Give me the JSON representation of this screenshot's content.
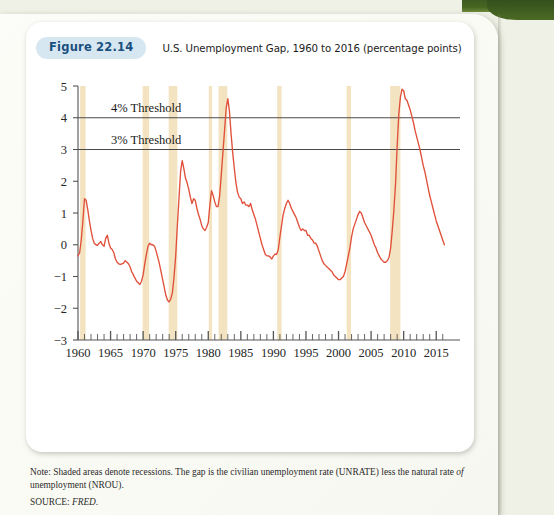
{
  "figure": {
    "badge": "Figure 22.14",
    "title": "U.S. Unemployment Gap, 1960 to 2016 (percentage points)"
  },
  "notes": {
    "note_prefix": "Note: Shaded areas denote recessions. The gap is the civilian unemployment rate (UNRATE) less the natural rate ",
    "note_italic": "of",
    "note_suffix": " unemployment (NROU).",
    "source_label": "SOURCE: ",
    "source_value": "FRED."
  },
  "colors": {
    "line": "#e0503a",
    "recession_band": "#f3e3c0",
    "threshold_line": "#4a4a4a",
    "axis": "#555555",
    "badge_bg": "#d7e7f2",
    "badge_text": "#19507e",
    "card_bg": "#ffffff",
    "page_bg": "#f0f1e6",
    "green_strip": "#46661f"
  },
  "chart_data": {
    "type": "line",
    "title": "U.S. Unemployment Gap, 1960 to 2016 (percentage points)",
    "xlabel": "",
    "ylabel": "",
    "xlim": [
      1960,
      2016.5
    ],
    "ylim": [
      -3,
      5
    ],
    "grid": false,
    "legend": "none",
    "y_ticks": [
      -3,
      -2,
      -1,
      0,
      1,
      2,
      3,
      4,
      5
    ],
    "y_tick_labels": [
      "−3",
      "−2",
      "−1",
      "0",
      "1",
      "2",
      "3",
      "4",
      "5"
    ],
    "x_ticks_major": [
      1960,
      1965,
      1970,
      1975,
      1980,
      1985,
      1990,
      1995,
      2000,
      2005,
      2010,
      2015
    ],
    "x_tick_labels": [
      "1960",
      "1965",
      "1970",
      "1975",
      "1980",
      "1985",
      "1990",
      "1995",
      "2000",
      "2005",
      "2010",
      "2015"
    ],
    "x_minor_tick_step": 1,
    "annotations": [
      {
        "label": "4% Threshold",
        "y": 4,
        "type": "hline"
      },
      {
        "label": "3% Threshold",
        "y": 3,
        "type": "hline"
      }
    ],
    "recessions": [
      {
        "start": 1960.33,
        "end": 1961.17
      },
      {
        "start": 1969.92,
        "end": 1970.92
      },
      {
        "start": 1973.92,
        "end": 1975.25
      },
      {
        "start": 1980.08,
        "end": 1980.58
      },
      {
        "start": 1981.58,
        "end": 1982.92
      },
      {
        "start": 1990.58,
        "end": 1991.25
      },
      {
        "start": 2001.25,
        "end": 2001.92
      },
      {
        "start": 2007.92,
        "end": 2009.5
      }
    ],
    "series": [
      {
        "name": "Unemployment gap (UNRATE − NROU)",
        "color": "#e0503a",
        "x": [
          1960.0,
          1960.25,
          1960.5,
          1960.75,
          1961.0,
          1961.25,
          1961.5,
          1961.75,
          1962.0,
          1962.25,
          1962.5,
          1962.75,
          1963.0,
          1963.25,
          1963.5,
          1963.75,
          1964.0,
          1964.25,
          1964.5,
          1964.75,
          1965.0,
          1965.25,
          1965.5,
          1965.75,
          1966.0,
          1966.25,
          1966.5,
          1966.75,
          1967.0,
          1967.25,
          1967.5,
          1967.75,
          1968.0,
          1968.25,
          1968.5,
          1968.75,
          1969.0,
          1969.25,
          1969.5,
          1969.75,
          1970.0,
          1970.25,
          1970.5,
          1970.75,
          1971.0,
          1971.25,
          1971.5,
          1971.75,
          1972.0,
          1972.25,
          1972.5,
          1972.75,
          1973.0,
          1973.25,
          1973.5,
          1973.75,
          1974.0,
          1974.25,
          1974.5,
          1974.75,
          1975.0,
          1975.25,
          1975.5,
          1975.75,
          1976.0,
          1976.25,
          1976.5,
          1976.75,
          1977.0,
          1977.25,
          1977.5,
          1977.75,
          1978.0,
          1978.25,
          1978.5,
          1978.75,
          1979.0,
          1979.25,
          1979.5,
          1979.75,
          1980.0,
          1980.25,
          1980.5,
          1980.75,
          1981.0,
          1981.25,
          1981.5,
          1981.75,
          1982.0,
          1982.25,
          1982.5,
          1982.75,
          1983.0,
          1983.25,
          1983.5,
          1983.75,
          1984.0,
          1984.25,
          1984.5,
          1984.75,
          1985.0,
          1985.25,
          1985.5,
          1985.75,
          1986.0,
          1986.25,
          1986.5,
          1986.75,
          1987.0,
          1987.25,
          1987.5,
          1987.75,
          1988.0,
          1988.25,
          1988.5,
          1988.75,
          1989.0,
          1989.25,
          1989.5,
          1989.75,
          1990.0,
          1990.25,
          1990.5,
          1990.75,
          1991.0,
          1991.25,
          1991.5,
          1991.75,
          1992.0,
          1992.25,
          1992.5,
          1992.75,
          1993.0,
          1993.25,
          1993.5,
          1993.75,
          1994.0,
          1994.25,
          1994.5,
          1994.75,
          1995.0,
          1995.25,
          1995.5,
          1995.75,
          1996.0,
          1996.25,
          1996.5,
          1996.75,
          1997.0,
          1997.25,
          1997.5,
          1997.75,
          1998.0,
          1998.25,
          1998.5,
          1998.75,
          1999.0,
          1999.25,
          1999.5,
          1999.75,
          2000.0,
          2000.25,
          2000.5,
          2000.75,
          2001.0,
          2001.25,
          2001.5,
          2001.75,
          2002.0,
          2002.25,
          2002.5,
          2002.75,
          2003.0,
          2003.25,
          2003.5,
          2003.75,
          2004.0,
          2004.25,
          2004.5,
          2004.75,
          2005.0,
          2005.25,
          2005.5,
          2005.75,
          2006.0,
          2006.25,
          2006.5,
          2006.75,
          2007.0,
          2007.25,
          2007.5,
          2007.75,
          2008.0,
          2008.25,
          2008.5,
          2008.75,
          2009.0,
          2009.25,
          2009.5,
          2009.75,
          2010.0,
          2010.25,
          2010.5,
          2010.75,
          2011.0,
          2011.25,
          2011.5,
          2011.75,
          2012.0,
          2012.25,
          2012.5,
          2012.75,
          2013.0,
          2013.25,
          2013.5,
          2013.75,
          2014.0,
          2014.25,
          2014.5,
          2014.75,
          2015.0,
          2015.25,
          2015.5,
          2015.75,
          2016.0,
          2016.25
        ],
        "y": [
          -0.35,
          -0.25,
          0.15,
          0.75,
          1.45,
          1.4,
          1.1,
          0.75,
          0.45,
          0.2,
          0.05,
          0.0,
          -0.02,
          0.05,
          0.1,
          0.0,
          -0.05,
          0.2,
          0.3,
          0.05,
          -0.1,
          -0.15,
          -0.25,
          -0.45,
          -0.55,
          -0.6,
          -0.62,
          -0.6,
          -0.58,
          -0.5,
          -0.55,
          -0.6,
          -0.7,
          -0.85,
          -0.95,
          -1.05,
          -1.15,
          -1.2,
          -1.25,
          -1.15,
          -0.95,
          -0.6,
          -0.3,
          -0.05,
          0.05,
          0.0,
          0.0,
          -0.05,
          -0.2,
          -0.4,
          -0.6,
          -0.85,
          -1.1,
          -1.35,
          -1.6,
          -1.75,
          -1.8,
          -1.7,
          -1.5,
          -1.0,
          -0.35,
          0.6,
          1.45,
          2.3,
          2.65,
          2.4,
          2.1,
          1.95,
          1.75,
          1.5,
          1.3,
          1.45,
          1.4,
          1.15,
          0.95,
          0.8,
          0.6,
          0.5,
          0.45,
          0.55,
          0.7,
          1.25,
          1.7,
          1.55,
          1.35,
          1.2,
          1.2,
          1.55,
          2.2,
          2.9,
          3.6,
          4.3,
          4.6,
          4.2,
          3.5,
          2.9,
          2.4,
          1.95,
          1.65,
          1.5,
          1.45,
          1.3,
          1.35,
          1.25,
          1.25,
          1.2,
          1.3,
          1.1,
          0.95,
          0.8,
          0.6,
          0.4,
          0.2,
          0.0,
          -0.15,
          -0.3,
          -0.35,
          -0.35,
          -0.38,
          -0.45,
          -0.35,
          -0.3,
          -0.3,
          -0.15,
          0.25,
          0.6,
          0.95,
          1.15,
          1.3,
          1.4,
          1.3,
          1.15,
          1.05,
          0.95,
          0.85,
          0.7,
          0.55,
          0.45,
          0.5,
          0.45,
          0.45,
          0.3,
          0.3,
          0.2,
          0.15,
          0.05,
          0.05,
          -0.05,
          -0.2,
          -0.35,
          -0.5,
          -0.6,
          -0.65,
          -0.7,
          -0.75,
          -0.8,
          -0.85,
          -0.95,
          -1.0,
          -1.05,
          -1.1,
          -1.1,
          -1.05,
          -1.0,
          -0.85,
          -0.6,
          -0.35,
          -0.1,
          0.25,
          0.5,
          0.65,
          0.8,
          0.95,
          1.05,
          1.0,
          0.85,
          0.7,
          0.6,
          0.5,
          0.4,
          0.3,
          0.15,
          0.0,
          -0.1,
          -0.25,
          -0.35,
          -0.45,
          -0.5,
          -0.55,
          -0.55,
          -0.5,
          -0.4,
          -0.1,
          0.45,
          1.1,
          1.9,
          3.1,
          4.1,
          4.65,
          4.9,
          4.85,
          4.6,
          4.55,
          4.4,
          4.25,
          4.05,
          3.85,
          3.6,
          3.4,
          3.2,
          3.0,
          2.75,
          2.5,
          2.3,
          2.05,
          1.8,
          1.55,
          1.35,
          1.15,
          0.95,
          0.75,
          0.6,
          0.45,
          0.3,
          0.15,
          0.0
        ]
      }
    ]
  }
}
